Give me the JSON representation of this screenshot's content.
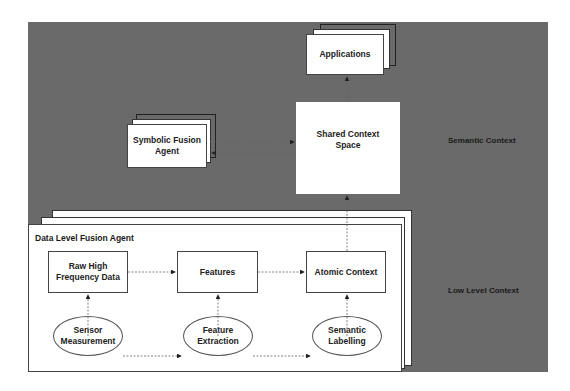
{
  "diagram": {
    "nodes": {
      "applications": "Applications",
      "symbolic_fusion_agent": "Symbolic Fusion Agent",
      "shared_context_space": "Shared Context Space",
      "data_level_fusion_agent": "Data Level Fusion Agent",
      "raw_high_frequency_data": "Raw High Frequency Data",
      "features": "Features",
      "atomic_context": "Atomic Context",
      "sensor_measurement": "Sensor Measurement",
      "feature_extraction": "Feature Extraction",
      "semantic_labelling": "Semantic Labelling"
    },
    "layers": {
      "semantic": "Semantic Context",
      "low_level": "Low Level Context"
    },
    "edges": [
      {
        "from": "Sensor Measurement",
        "to": "Raw High Frequency Data"
      },
      {
        "from": "Sensor Measurement",
        "to": "Feature Extraction"
      },
      {
        "from": "Feature Extraction",
        "to": "Features"
      },
      {
        "from": "Feature Extraction",
        "to": "Semantic Labelling"
      },
      {
        "from": "Semantic Labelling",
        "to": "Atomic Context"
      },
      {
        "from": "Raw High Frequency Data",
        "to": "Features"
      },
      {
        "from": "Features",
        "to": "Atomic Context"
      },
      {
        "from": "Atomic Context",
        "to": "Shared Context Space"
      },
      {
        "from": "Shared Context Space",
        "to": "Applications"
      },
      {
        "from": "Symbolic Fusion Agent",
        "to": "Shared Context Space"
      },
      {
        "from": "Shared Context Space",
        "to": "Symbolic Fusion Agent"
      }
    ],
    "colors": {
      "background_panel": "#6a6a6a",
      "box_fill": "#ffffff",
      "line": "#444444"
    }
  }
}
